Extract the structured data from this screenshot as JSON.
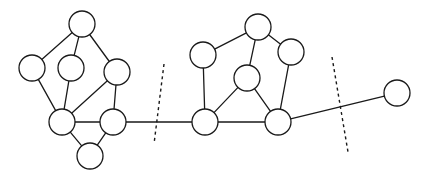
{
  "figure": {
    "background_color": "#ffffff",
    "stroke_color": "#1a1a1a",
    "node_fill": "#ffffff",
    "width": 430,
    "height": 180
  },
  "chart_data": {
    "type": "diagram",
    "subtype": "node-link-graph",
    "title": "",
    "node_radius": 13,
    "nodes": [
      {
        "id": "L1",
        "x": 82,
        "y": 24,
        "r": 13,
        "group": "left"
      },
      {
        "id": "L2",
        "x": 32,
        "y": 68,
        "r": 13,
        "group": "left"
      },
      {
        "id": "L3",
        "x": 71,
        "y": 68,
        "r": 13,
        "group": "left"
      },
      {
        "id": "L4",
        "x": 117,
        "y": 72,
        "r": 13,
        "group": "left"
      },
      {
        "id": "L5",
        "x": 62,
        "y": 122,
        "r": 13,
        "group": "left"
      },
      {
        "id": "L6",
        "x": 113,
        "y": 122,
        "r": 13,
        "group": "left"
      },
      {
        "id": "L7",
        "x": 90,
        "y": 156,
        "r": 13,
        "group": "left"
      },
      {
        "id": "R1",
        "x": 258,
        "y": 27,
        "r": 13,
        "group": "middle"
      },
      {
        "id": "R2",
        "x": 203,
        "y": 55,
        "r": 13,
        "group": "middle"
      },
      {
        "id": "R3",
        "x": 291,
        "y": 52,
        "r": 13,
        "group": "middle"
      },
      {
        "id": "R4",
        "x": 247,
        "y": 78,
        "r": 13,
        "group": "middle"
      },
      {
        "id": "R5",
        "x": 205,
        "y": 122,
        "r": 13,
        "group": "middle"
      },
      {
        "id": "R6",
        "x": 278,
        "y": 122,
        "r": 13,
        "group": "middle"
      },
      {
        "id": "S1",
        "x": 397,
        "y": 93,
        "r": 13,
        "group": "right"
      }
    ],
    "edges": [
      {
        "source": "L1",
        "target": "L2"
      },
      {
        "source": "L1",
        "target": "L3"
      },
      {
        "source": "L1",
        "target": "L4"
      },
      {
        "source": "L2",
        "target": "L5"
      },
      {
        "source": "L3",
        "target": "L5"
      },
      {
        "source": "L4",
        "target": "L5"
      },
      {
        "source": "L4",
        "target": "L6"
      },
      {
        "source": "L5",
        "target": "L6"
      },
      {
        "source": "L5",
        "target": "L7"
      },
      {
        "source": "L6",
        "target": "L7"
      },
      {
        "source": "L6",
        "target": "R5"
      },
      {
        "source": "R1",
        "target": "R2"
      },
      {
        "source": "R1",
        "target": "R3"
      },
      {
        "source": "R1",
        "target": "R4"
      },
      {
        "source": "R2",
        "target": "R5"
      },
      {
        "source": "R3",
        "target": "R6"
      },
      {
        "source": "R4",
        "target": "R5"
      },
      {
        "source": "R4",
        "target": "R6"
      },
      {
        "source": "R5",
        "target": "R6"
      },
      {
        "source": "R6",
        "target": "S1"
      }
    ],
    "cut_lines": [
      {
        "id": "cut-1",
        "x1": 164,
        "y1": 64,
        "x2": 154,
        "y2": 144
      },
      {
        "id": "cut-2",
        "x1": 332,
        "y1": 57,
        "x2": 348,
        "y2": 152
      }
    ],
    "node_count": 14,
    "edge_count": 20,
    "cut_count": 2
  }
}
